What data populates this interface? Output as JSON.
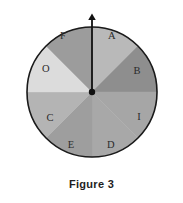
{
  "figure": {
    "caption": "Figure 3",
    "background_color": "#ffffff",
    "outline_color": "#1a1a1a"
  },
  "chart_data": {
    "type": "pie",
    "title": "Figure 3",
    "subtitle": "",
    "xlabel": "",
    "ylabel": "",
    "legend_position": "none",
    "grid": false,
    "note": "Spinner wheel divided into 8 equal sectors of 45 degrees each, with a pointer arrow fixed at the top (12 o'clock) position.",
    "center": {
      "x": 92,
      "y": 92
    },
    "radius": 65,
    "sector_count": 8,
    "sector_angle_degrees": 45,
    "equal_slices": true,
    "categories": [
      "A",
      "B",
      "I",
      "D",
      "E",
      "C",
      "O",
      "F"
    ],
    "values": [
      45,
      45,
      45,
      45,
      45,
      45,
      45,
      45
    ],
    "slices": [
      {
        "label": "A",
        "start_angle_deg": 0,
        "end_angle_deg": 45,
        "value": 45,
        "fill": "#b9b9b9",
        "label_x": 112,
        "label_y": 37
      },
      {
        "label": "B",
        "start_angle_deg": 45,
        "end_angle_deg": 90,
        "value": 45,
        "fill": "#8e8e8e",
        "label_x": 137,
        "label_y": 72
      },
      {
        "label": "I",
        "start_angle_deg": 90,
        "end_angle_deg": 135,
        "value": 45,
        "fill": "#a6a6a6",
        "label_x": 139,
        "label_y": 118
      },
      {
        "label": "D",
        "start_angle_deg": 135,
        "end_angle_deg": 180,
        "value": 45,
        "fill": "#a8a8a8",
        "label_x": 111,
        "label_y": 146
      },
      {
        "label": "E",
        "start_angle_deg": 180,
        "end_angle_deg": 225,
        "value": 45,
        "fill": "#9e9e9e",
        "label_x": 71,
        "label_y": 146
      },
      {
        "label": "C",
        "start_angle_deg": 225,
        "end_angle_deg": 270,
        "value": 45,
        "fill": "#b4b4b4",
        "label_x": 50,
        "label_y": 119
      },
      {
        "label": "O",
        "start_angle_deg": 270,
        "end_angle_deg": 315,
        "value": 45,
        "fill": "#dcdcdc",
        "label_x": 46,
        "label_y": 70
      },
      {
        "label": "F",
        "start_angle_deg": 315,
        "end_angle_deg": 360,
        "value": 45,
        "fill": "#9c9c9c",
        "label_x": 63,
        "label_y": 37
      }
    ],
    "pointer": {
      "name": "spinner-arrow",
      "direction": "up",
      "from_x": 92,
      "from_y": 92,
      "to_x": 92,
      "to_y": 12,
      "color": "#111111"
    },
    "hub": {
      "name": "spinner-hub",
      "x": 92,
      "y": 92,
      "radius": 3.2,
      "color": "#111111"
    }
  }
}
